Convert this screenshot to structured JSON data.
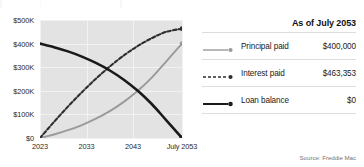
{
  "chart_data": {
    "type": "line",
    "title": "",
    "xlabel": "",
    "ylabel": "",
    "ylim": [
      0,
      500000
    ],
    "xlim": [
      2023,
      2053.5
    ],
    "grid": true,
    "legend_position": "right",
    "y_ticks": [
      "$0",
      "$100K",
      "$200K",
      "$300K",
      "$400K",
      "$500K"
    ],
    "y_tick_values": [
      0,
      100000,
      200000,
      300000,
      400000,
      500000
    ],
    "x_ticks": [
      "2023",
      "2033",
      "2043",
      "July 2053"
    ],
    "x_tick_values": [
      2023,
      2033,
      2043,
      2053.5
    ],
    "series": [
      {
        "name": "Loan balance",
        "style": "solid-thick",
        "color": "#1a1a1a",
        "end_value": 0,
        "end_label": "$0",
        "x": [
          2023,
          2026,
          2029,
          2032,
          2035,
          2038,
          2041,
          2044,
          2047,
          2050,
          2053.5
        ],
        "values": [
          400000,
          385000,
          367000,
          345000,
          318000,
          286000,
          247000,
          200000,
          144000,
          78000,
          0
        ]
      },
      {
        "name": "Interest paid",
        "style": "dashed",
        "color": "#2e2e2e",
        "end_value": 463353,
        "end_label": "$463,353",
        "x": [
          2023,
          2026,
          2029,
          2032,
          2035,
          2038,
          2041,
          2044,
          2047,
          2050,
          2053.5
        ],
        "values": [
          0,
          68000,
          133000,
          194000,
          251000,
          303000,
          350000,
          390000,
          423000,
          449000,
          463353
        ]
      },
      {
        "name": "Principal paid",
        "style": "solid-gray",
        "color": "#9a9a9a",
        "end_value": 400000,
        "end_label": "$400,000",
        "x": [
          2023,
          2026,
          2029,
          2032,
          2035,
          2038,
          2041,
          2044,
          2047,
          2050,
          2053.5
        ],
        "values": [
          0,
          15000,
          33000,
          55000,
          82000,
          114000,
          153000,
          200000,
          256000,
          322000,
          400000
        ]
      }
    ]
  },
  "legend": {
    "title": "As of July 2053",
    "rows": [
      {
        "label": "Principal paid",
        "value": "$400,000",
        "marker": "solid-gray-dot"
      },
      {
        "label": "Interest paid",
        "value": "$463,353",
        "marker": "dashed-dot"
      },
      {
        "label": "Loan balance",
        "value": "$0",
        "marker": "solid-black-dot"
      }
    ]
  },
  "source": "Source: Freddie Mac"
}
